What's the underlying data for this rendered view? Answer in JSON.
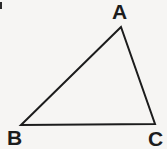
{
  "figure": {
    "kind": "geometry-diagram",
    "shape": "triangle",
    "name": "Triangle ABC",
    "width": 167,
    "height": 149,
    "background_color": "#f6f5f3",
    "stroke_color": "#1c1c1c",
    "stroke_width": 2,
    "label_color": "#1c1c1c"
  },
  "vertices": [
    {
      "id": "A",
      "label": "A",
      "x": 121,
      "y": 27,
      "label_x": 112,
      "label_y": 1,
      "position": "top"
    },
    {
      "id": "B",
      "label": "B",
      "x": 21,
      "y": 125,
      "label_x": 7,
      "label_y": 127,
      "position": "bottom-left"
    },
    {
      "id": "C",
      "label": "C",
      "x": 155,
      "y": 124,
      "label_x": 148,
      "label_y": 128,
      "position": "bottom-right"
    }
  ],
  "edges": [
    {
      "id": "AB",
      "from": "A",
      "to": "B"
    },
    {
      "id": "BC",
      "from": "B",
      "to": "C"
    },
    {
      "id": "CA",
      "from": "C",
      "to": "A"
    }
  ],
  "artifacts": [
    {
      "id": "scan-mark-top-left",
      "x": 0,
      "y": 2,
      "width": 2,
      "height": 7,
      "color": "#2a2a2a"
    }
  ]
}
